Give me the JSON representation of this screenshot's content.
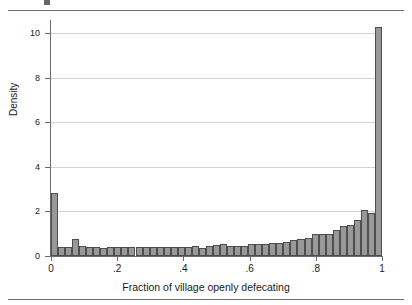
{
  "figure": {
    "top_rule": "",
    "bottom_rule": ""
  },
  "axes": {
    "ylabel": "Density",
    "xlabel": "Fraction of village openly defecating",
    "yticks": [
      "0",
      "2",
      "4",
      "6",
      "8",
      "10"
    ],
    "xticks": [
      "0",
      ".2",
      ".4",
      ".6",
      ".8",
      "1"
    ]
  },
  "colors": {
    "bar_fill": "#999999",
    "bar_stroke": "#4e4e4e",
    "grid": "#d2d2d2",
    "axis": "#6b6b6b",
    "rule": "#6e6e6e"
  },
  "chart_data": {
    "type": "bar",
    "title": "",
    "subtitle": "",
    "xlabel": "Fraction of village openly defecating",
    "ylabel": "Density",
    "xlim": [
      0,
      1
    ],
    "ylim": [
      0,
      10.6
    ],
    "xticks": [
      0,
      0.2,
      0.4,
      0.6,
      0.8,
      1
    ],
    "xtick_labels": [
      "0",
      ".2",
      ".4",
      ".6",
      ".8",
      "1"
    ],
    "yticks": [
      0,
      2,
      4,
      6,
      8,
      10
    ],
    "ytick_labels": [
      "0",
      "2",
      "4",
      "6",
      "8",
      "10"
    ],
    "grid": "horizontal",
    "legend": "none",
    "bin_width": 0.02127659574,
    "n_bins": 47,
    "bin_starts": [
      0.0,
      0.0213,
      0.0426,
      0.0638,
      0.0851,
      0.1064,
      0.1277,
      0.1489,
      0.1702,
      0.1915,
      0.2128,
      0.234,
      0.2553,
      0.2766,
      0.2979,
      0.3191,
      0.3404,
      0.3617,
      0.383,
      0.4043,
      0.4255,
      0.4468,
      0.4681,
      0.4894,
      0.5106,
      0.5319,
      0.5532,
      0.5745,
      0.5957,
      0.617,
      0.6383,
      0.6596,
      0.6809,
      0.7021,
      0.7234,
      0.7447,
      0.766,
      0.7872,
      0.8085,
      0.8298,
      0.8511,
      0.8723,
      0.8936,
      0.9149,
      0.9362,
      0.9574,
      0.9787
    ],
    "categories": [
      "0.00",
      "0.02",
      "0.04",
      "0.06",
      "0.09",
      "0.11",
      "0.13",
      "0.15",
      "0.17",
      "0.19",
      "0.21",
      "0.23",
      "0.26",
      "0.28",
      "0.30",
      "0.32",
      "0.34",
      "0.36",
      "0.38",
      "0.40",
      "0.43",
      "0.45",
      "0.47",
      "0.49",
      "0.51",
      "0.53",
      "0.55",
      "0.57",
      "0.60",
      "0.62",
      "0.64",
      "0.66",
      "0.68",
      "0.70",
      "0.72",
      "0.74",
      "0.77",
      "0.79",
      "0.81",
      "0.83",
      "0.85",
      "0.87",
      "0.89",
      "0.91",
      "0.94",
      "0.96",
      "0.98"
    ],
    "values": [
      2.82,
      0.42,
      0.42,
      0.75,
      0.47,
      0.42,
      0.41,
      0.38,
      0.42,
      0.41,
      0.42,
      0.41,
      0.4,
      0.41,
      0.41,
      0.41,
      0.4,
      0.39,
      0.41,
      0.4,
      0.46,
      0.36,
      0.45,
      0.49,
      0.52,
      0.45,
      0.45,
      0.46,
      0.52,
      0.55,
      0.56,
      0.58,
      0.59,
      0.64,
      0.72,
      0.78,
      0.8,
      0.97,
      1.0,
      0.99,
      1.18,
      1.35,
      1.4,
      1.62,
      2.08,
      1.92,
      10.3
    ],
    "series": [
      {
        "name": "Density",
        "values": [
          2.82,
          0.42,
          0.42,
          0.75,
          0.47,
          0.42,
          0.41,
          0.38,
          0.42,
          0.41,
          0.42,
          0.41,
          0.4,
          0.41,
          0.41,
          0.41,
          0.4,
          0.39,
          0.41,
          0.4,
          0.46,
          0.36,
          0.45,
          0.49,
          0.52,
          0.45,
          0.45,
          0.46,
          0.52,
          0.55,
          0.56,
          0.58,
          0.59,
          0.64,
          0.72,
          0.78,
          0.8,
          0.97,
          1.0,
          0.99,
          1.18,
          1.35,
          1.4,
          1.62,
          2.08,
          1.92,
          10.3
        ]
      }
    ]
  }
}
